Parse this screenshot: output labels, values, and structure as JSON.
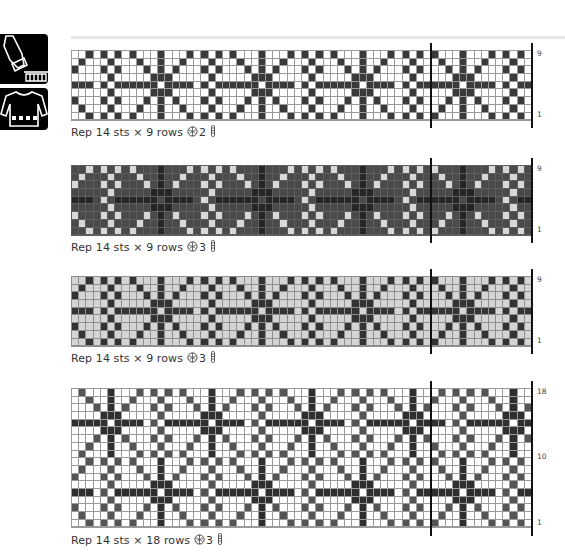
{
  "side_tabs": [
    {
      "icon": "sleeve-cuff-icon"
    },
    {
      "icon": "sweater-icon"
    }
  ],
  "charts": [
    {
      "caption": {
        "text": "Rep 14 sts × 9 rows",
        "colors_count": "2",
        "yarn_icon": "yarn-ball-icon",
        "needle_icon": "needle-icon"
      },
      "rows": 9,
      "row_labels": [
        "9",
        "1"
      ],
      "palette": {
        "bg": "#ffffff",
        "motif": "#3a3a3a",
        "check": "#3a3a3a",
        "line": "#9a9a9a"
      },
      "offset": 0,
      "top": 50
    },
    {
      "caption": {
        "text": "Rep 14 sts × 9 rows",
        "colors_count": "3",
        "yarn_icon": "yarn-ball-icon",
        "needle_icon": "needle-icon"
      },
      "rows": 9,
      "row_labels": [
        "9",
        "1"
      ],
      "palette": {
        "bg": "#4a4a4a",
        "motif": "#262626",
        "check": "#d8d8d8",
        "line": "#5e5e5e"
      },
      "offset": 0,
      "top": 165
    },
    {
      "caption": {
        "text": "Rep 14 sts × 9 rows",
        "colors_count": "3",
        "yarn_icon": "yarn-ball-icon",
        "needle_icon": "needle-icon"
      },
      "rows": 9,
      "row_labels": [
        "9",
        "1"
      ],
      "palette": {
        "bg": "#d4d4d4",
        "motif": "#333333",
        "check": "#333333",
        "line": "#8f8f8f"
      },
      "offset": 0,
      "top": 276
    },
    {
      "caption": {
        "text": "Rep 14 sts × 18 rows",
        "colors_count": "3",
        "yarn_icon": "yarn-ball-icon",
        "needle_icon": "needle-icon"
      },
      "rows": 18,
      "row_labels": [
        "18",
        "10",
        "1"
      ],
      "palette": {
        "bg": "#ffffff",
        "motif": "#2f2f2f",
        "check": "#555555",
        "line": "#9a9a9a"
      },
      "offset": 7,
      "top": 388
    }
  ],
  "motif": {
    "repeat_stitches": 14,
    "total_stitches": 64,
    "repeat_marker_col": 50,
    "rows_top_to_bottom": [
      {
        "check": [
          2,
          4,
          6,
          8
        ],
        "motif": [
          12
        ]
      },
      {
        "check": [
          1,
          5,
          9
        ],
        "motif": [
          12
        ]
      },
      {
        "check": [
          0,
          4,
          6,
          10
        ],
        "motif": [
          12
        ]
      },
      {
        "check": [
          5
        ],
        "motif": [
          11,
          12,
          13
        ]
      },
      {
        "check": [
          4
        ],
        "motif": [
          0,
          1,
          2,
          6,
          7,
          8,
          9,
          10,
          11,
          13
        ]
      },
      {
        "check": [
          5
        ],
        "motif": [
          11,
          12,
          13
        ]
      },
      {
        "check": [
          0,
          4,
          6,
          10
        ],
        "motif": [
          12
        ]
      },
      {
        "check": [
          1,
          5,
          9
        ],
        "motif": [
          12
        ]
      },
      {
        "check": [
          2,
          4,
          6,
          8
        ],
        "motif": [
          12
        ]
      }
    ]
  }
}
